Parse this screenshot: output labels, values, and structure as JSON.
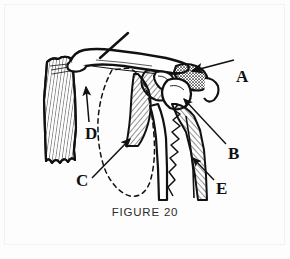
{
  "figure": {
    "caption": "FIGURE 20",
    "background_color": "#fdfdfd",
    "ink_color": "#111111",
    "border_color": "#f2f2f2"
  },
  "labels": [
    {
      "id": "A",
      "text": "A",
      "x": 236,
      "y": 68,
      "arrow_from": [
        232,
        62
      ],
      "arrow_to": [
        186,
        72
      ],
      "target": "distal-clavicle-acromion-junction"
    },
    {
      "id": "B",
      "text": "B",
      "x": 228,
      "y": 145,
      "arrow_from": [
        226,
        146
      ],
      "arrow_to": [
        182,
        97
      ],
      "target": "humeral-head-glenoid"
    },
    {
      "id": "C",
      "text": "C",
      "x": 76,
      "y": 172,
      "arrow_from": [
        90,
        178
      ],
      "arrow_to": [
        130,
        138
      ],
      "target": "scapula-dashed-outline"
    },
    {
      "id": "D",
      "text": "D",
      "x": 85,
      "y": 125,
      "arrow_from": [
        89,
        122
      ],
      "arrow_to": [
        86,
        86
      ],
      "target": "sternoclavicular-joint"
    },
    {
      "id": "E",
      "text": "E",
      "x": 216,
      "y": 180,
      "arrow_from": [
        213,
        182
      ],
      "arrow_to": [
        191,
        157
      ],
      "target": "humeral-shaft-fracture-line"
    }
  ],
  "pointers": [
    {
      "id": "unlabeled-clavicle-pointer",
      "from": [
        128,
        34
      ],
      "to": [
        97,
        62
      ],
      "target": "mid-clavicle"
    }
  ],
  "structures": [
    {
      "name": "clavicle",
      "description": "long horizontal bone across top of figure"
    },
    {
      "name": "sternum-fragment",
      "description": "vertically hatched bone block at left with jagged inferior margin"
    },
    {
      "name": "scapula-outline",
      "description": "dashed oval indicating scapular body position"
    },
    {
      "name": "acromion",
      "description": "stippled / cross-hatched process at right of clavicle"
    },
    {
      "name": "humerus",
      "description": "hatched shaft descending at right with jagged fracture line"
    },
    {
      "name": "glenoid-coracoid",
      "description": "hatched wedge structures beneath acromion"
    }
  ]
}
